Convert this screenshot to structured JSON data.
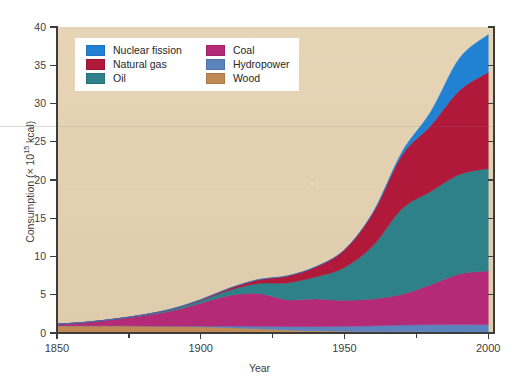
{
  "chart_data": {
    "type": "area",
    "title": "",
    "subtitle": "",
    "xlabel": "Year",
    "ylabel": "Consumption (× 10¹⁵ kcal)",
    "ylabel_parts": {
      "prefix": "Consumption (× 10",
      "exponent": "15",
      "suffix": " kcal)"
    },
    "stacked": true,
    "grid": false,
    "legend_position": "top-left-inside",
    "xlim": [
      1850,
      2002
    ],
    "ylim": [
      0,
      40
    ],
    "x_ticks": [
      1850,
      1900,
      1950,
      2000
    ],
    "x_tick_labels": [
      "1850",
      "1900",
      "1950",
      "2000"
    ],
    "x_minor_ticks": [
      1875,
      1925,
      1975
    ],
    "y_ticks": [
      0,
      5,
      10,
      15,
      20,
      25,
      30,
      35,
      40
    ],
    "y_tick_labels": [
      "0",
      "5",
      "10",
      "15",
      "20",
      "25",
      "30",
      "35",
      "40"
    ],
    "x": [
      1850,
      1860,
      1870,
      1880,
      1890,
      1900,
      1910,
      1920,
      1930,
      1940,
      1950,
      1960,
      1970,
      1980,
      1990,
      2000
    ],
    "stack_order_bottom_to_top": [
      "Wood",
      "Hydropower",
      "Coal",
      "Oil",
      "Natural gas",
      "Nuclear fission"
    ],
    "series": [
      {
        "name": "Wood",
        "color": "#bf8a54",
        "values": [
          0.95,
          0.95,
          0.95,
          0.92,
          0.88,
          0.82,
          0.7,
          0.55,
          0.4,
          0.3,
          0.22,
          0.18,
          0.15,
          0.13,
          0.12,
          0.1
        ]
      },
      {
        "name": "Hydropower",
        "color": "#5b83bd",
        "values": [
          0.0,
          0.0,
          0.0,
          0.0,
          0.02,
          0.08,
          0.2,
          0.32,
          0.45,
          0.55,
          0.65,
          0.78,
          0.9,
          0.98,
          1.0,
          1.0
        ]
      },
      {
        "name": "Coal",
        "color": "#b42a77",
        "values": [
          0.2,
          0.45,
          0.85,
          1.35,
          2.0,
          3.0,
          4.0,
          4.3,
          3.5,
          3.6,
          3.4,
          3.5,
          4.0,
          5.2,
          6.6,
          7.0
        ]
      },
      {
        "name": "Oil",
        "color": "#2e8189",
        "values": [
          0.0,
          0.0,
          0.02,
          0.08,
          0.2,
          0.35,
          0.7,
          1.3,
          2.2,
          2.9,
          4.3,
          7.0,
          11.2,
          12.2,
          13.0,
          13.4
        ]
      },
      {
        "name": "Natural gas",
        "color": "#b0193a",
        "values": [
          0.0,
          0.0,
          0.0,
          0.02,
          0.05,
          0.1,
          0.25,
          0.5,
          0.9,
          1.3,
          2.3,
          4.3,
          7.0,
          8.6,
          11.0,
          12.6
        ]
      },
      {
        "name": "Nuclear fission",
        "color": "#2182d4",
        "values": [
          0.0,
          0.0,
          0.0,
          0.0,
          0.0,
          0.0,
          0.0,
          0.0,
          0.0,
          0.0,
          0.0,
          0.05,
          0.4,
          1.8,
          4.2,
          4.9
        ]
      }
    ],
    "totals": [
      1.15,
      1.4,
      1.82,
      2.37,
      3.15,
      4.35,
      5.85,
      6.97,
      7.45,
      8.65,
      11.07,
      15.81,
      23.65,
      28.91,
      35.92,
      39.0
    ],
    "plot_background_color": "#e7d3b3",
    "figure_background_color": "#ffffff"
  },
  "legend": {
    "columns": [
      {
        "items": [
          {
            "label": "Nuclear fission",
            "color": "#2182d4"
          },
          {
            "label": "Natural gas",
            "color": "#b0193a"
          },
          {
            "label": "Oil",
            "color": "#2e8189"
          }
        ]
      },
      {
        "items": [
          {
            "label": "Coal",
            "color": "#b42a77"
          },
          {
            "label": "Hydropower",
            "color": "#5b83bd"
          },
          {
            "label": "Wood",
            "color": "#bf8a54"
          }
        ]
      }
    ]
  },
  "axes": {
    "x_title": "Year",
    "y_title_prefix": "Consumption (× 10",
    "y_title_exponent": "15",
    "y_title_suffix": " kcal)",
    "x_labels": [
      "1850",
      "1900",
      "1950",
      "2000"
    ],
    "y_labels": [
      "40",
      "35",
      "30",
      "25",
      "20",
      "15",
      "10",
      "5",
      "0"
    ]
  }
}
